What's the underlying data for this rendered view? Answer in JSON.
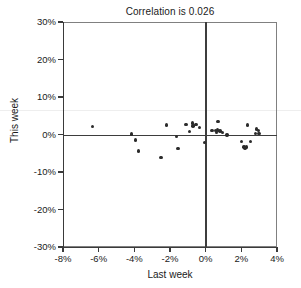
{
  "chart_data": {
    "type": "scatter",
    "title": "Correlation is 0.026",
    "xlabel": "Last week",
    "ylabel": "This week",
    "xlim": [
      -8,
      4
    ],
    "ylim": [
      -30,
      30
    ],
    "xticks": [
      "-8%",
      "-6%",
      "-4%",
      "-2%",
      "0%",
      "2%",
      "4%"
    ],
    "xtick_values": [
      -8,
      -6,
      -4,
      -2,
      0,
      2,
      4
    ],
    "yticks": [
      "30%",
      "20%",
      "10%",
      "0%",
      "-10%",
      "-20%",
      "-30%"
    ],
    "ytick_values": [
      30,
      20,
      10,
      0,
      -10,
      -20,
      -30
    ],
    "grid": false,
    "legend": null,
    "correlation": 0.026,
    "reference_lines": {
      "horizontal": 0,
      "vertical": 0
    },
    "marker_color": "#2b2b2b",
    "points": [
      {
        "x": -6.35,
        "y": 2.2
      },
      {
        "x": -4.15,
        "y": 0.1
      },
      {
        "x": -3.95,
        "y": -1.5
      },
      {
        "x": -3.75,
        "y": -4.4
      },
      {
        "x": -2.5,
        "y": -6.2
      },
      {
        "x": -2.2,
        "y": 2.5
      },
      {
        "x": -1.65,
        "y": -0.5
      },
      {
        "x": -1.55,
        "y": -3.7
      },
      {
        "x": -1.1,
        "y": 2.7
      },
      {
        "x": -0.9,
        "y": 0.8
      },
      {
        "x": -0.75,
        "y": 3.1
      },
      {
        "x": -0.7,
        "y": 2.3
      },
      {
        "x": -0.55,
        "y": 2.6
      },
      {
        "x": -0.35,
        "y": 1.9
      },
      {
        "x": -0.05,
        "y": -2.1
      },
      {
        "x": 0.35,
        "y": 1.1
      },
      {
        "x": 0.55,
        "y": 1.0
      },
      {
        "x": 0.6,
        "y": 0.6
      },
      {
        "x": 0.65,
        "y": 1.2
      },
      {
        "x": 0.7,
        "y": 3.5
      },
      {
        "x": 0.8,
        "y": 0.9
      },
      {
        "x": 0.95,
        "y": 0.5
      },
      {
        "x": 1.2,
        "y": -0.1
      },
      {
        "x": 2.0,
        "y": -1.9
      },
      {
        "x": 2.15,
        "y": -3.3
      },
      {
        "x": 2.2,
        "y": -3.6
      },
      {
        "x": 2.3,
        "y": -3.3
      },
      {
        "x": 2.35,
        "y": 2.5
      },
      {
        "x": 2.5,
        "y": -1.8
      },
      {
        "x": 2.8,
        "y": 0.2
      },
      {
        "x": 2.85,
        "y": 1.5
      },
      {
        "x": 2.95,
        "y": 1.1
      },
      {
        "x": 3.0,
        "y": 0.3
      }
    ]
  }
}
